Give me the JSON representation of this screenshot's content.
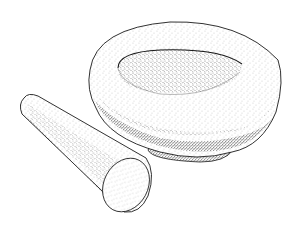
{
  "illustration": {
    "subject": "mortar and pestle",
    "style": "stippled pen-and-ink",
    "colors": {
      "background": "#ffffff",
      "ink": "#1a1a1a",
      "stipple": "#333333"
    },
    "objects": [
      {
        "name": "mortar",
        "description": "shallow round bowl with thick rim"
      },
      {
        "name": "pestle",
        "description": "tapered cylindrical grinder lying in front"
      }
    ]
  }
}
